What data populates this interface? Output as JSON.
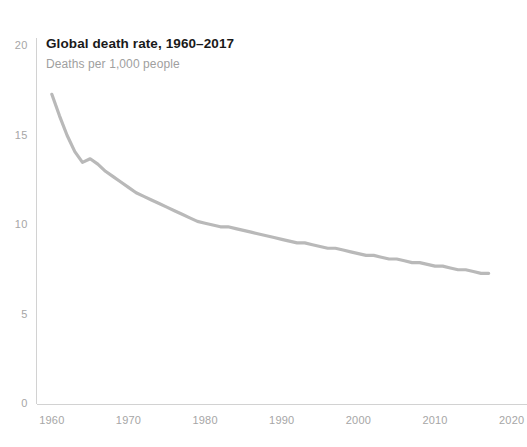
{
  "chart_data": {
    "type": "line",
    "title": "Global death rate, 1960–2017",
    "subtitle": "Deaths per 1,000 people",
    "xlabel": "",
    "ylabel": "",
    "ylim": [
      0,
      20
    ],
    "xlim": [
      1958,
      2022
    ],
    "grid": false,
    "legend": null,
    "line_color": "#b9b9b9",
    "axis_color": "#d2d2d2",
    "tick_label_color": "#a6a6a6",
    "title_color": "#1a1a1a",
    "subtitle_color": "#a0a0a0",
    "yticks": [
      0,
      5,
      10,
      15,
      20
    ],
    "ytick_labels": [
      "0",
      "5",
      "10",
      "15",
      "20"
    ],
    "xticks": [
      1960,
      1970,
      1980,
      1990,
      2000,
      2010,
      2020
    ],
    "xtick_labels": [
      "1960",
      "1970",
      "1980",
      "1990",
      "2000",
      "2010",
      "2020"
    ],
    "series": [
      {
        "name": "Global death rate",
        "x": [
          1960,
          1961,
          1962,
          1963,
          1964,
          1965,
          1966,
          1967,
          1968,
          1969,
          1970,
          1971,
          1972,
          1973,
          1974,
          1975,
          1976,
          1977,
          1978,
          1979,
          1980,
          1981,
          1982,
          1983,
          1984,
          1985,
          1986,
          1987,
          1988,
          1989,
          1990,
          1991,
          1992,
          1993,
          1994,
          1995,
          1996,
          1997,
          1998,
          1999,
          2000,
          2001,
          2002,
          2003,
          2004,
          2005,
          2006,
          2007,
          2008,
          2009,
          2010,
          2011,
          2012,
          2013,
          2014,
          2015,
          2016,
          2017
        ],
        "values": [
          17.3,
          16.1,
          15.0,
          14.1,
          13.5,
          13.7,
          13.4,
          13.0,
          12.7,
          12.4,
          12.1,
          11.8,
          11.6,
          11.4,
          11.2,
          11.0,
          10.8,
          10.6,
          10.4,
          10.2,
          10.1,
          10.0,
          9.9,
          9.9,
          9.8,
          9.7,
          9.6,
          9.5,
          9.4,
          9.3,
          9.2,
          9.1,
          9.0,
          9.0,
          8.9,
          8.8,
          8.7,
          8.7,
          8.6,
          8.5,
          8.4,
          8.3,
          8.3,
          8.2,
          8.1,
          8.1,
          8.0,
          7.9,
          7.9,
          7.8,
          7.7,
          7.7,
          7.6,
          7.5,
          7.5,
          7.4,
          7.3,
          7.3
        ]
      }
    ]
  }
}
